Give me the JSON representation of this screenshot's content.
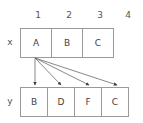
{
  "diagram": {
    "column_labels": [
      "1",
      "2",
      "3",
      "4"
    ],
    "rows": [
      {
        "name": "x",
        "label": "x",
        "cells": [
          "A",
          "B",
          "C"
        ]
      },
      {
        "name": "y",
        "label": "y",
        "cells": [
          "B",
          "D",
          "F",
          "C"
        ]
      }
    ],
    "arrows": [
      {
        "from": "x.1",
        "to": "y.1",
        "label": ""
      },
      {
        "from": "x.1",
        "to": "y.2",
        "label": ""
      },
      {
        "from": "x.1",
        "to": "y.3",
        "label": ""
      },
      {
        "from": "x.1",
        "to": "y.4",
        "label": ""
      }
    ],
    "colors": {
      "cell_border": "#9a9a9a",
      "text": "#444444",
      "label_text": "#555555",
      "arrow": "#555555",
      "background": "#ffffff"
    }
  }
}
